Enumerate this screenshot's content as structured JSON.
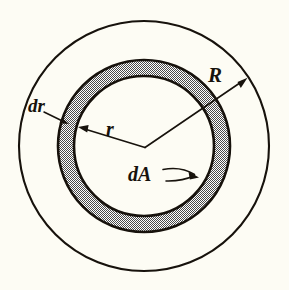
{
  "figure": {
    "background_color": "#fdfcf4",
    "ink_color": "#17120c",
    "shading_color": "#8c8c8c",
    "labels": {
      "dr": "dr",
      "r": "r",
      "R": "R",
      "dA": "dA"
    },
    "geometry": {
      "center_x": 144,
      "center_y": 146,
      "outer_circle_radius": 125,
      "annulus_outer_radius": 86,
      "annulus_inner_radius": 70,
      "ring_thickness": 16
    },
    "annotations": [
      {
        "name": "dr",
        "label": "dr",
        "description": "arrow pointing to ring thickness",
        "label_x": 36,
        "label_y": 112,
        "arrow_from_x": 45,
        "arrow_from_y": 113,
        "arrow_to_x": 68,
        "arrow_to_y": 124
      },
      {
        "name": "r",
        "label": "r",
        "description": "radius line from center to inner circle",
        "label_x": 112,
        "label_y": 134,
        "arrow_from_x": 145,
        "arrow_from_y": 147,
        "arrow_to_x": 79,
        "arrow_to_y": 127
      },
      {
        "name": "R",
        "label": "R",
        "description": "radius line from center to outer circle",
        "label_x": 213,
        "label_y": 78,
        "arrow_from_x": 145,
        "arrow_from_y": 147,
        "arrow_to_x": 247,
        "arrow_to_y": 78
      },
      {
        "name": "dA",
        "label": "dA",
        "description": "curved arrow pointing to shaded annulus area",
        "label_x": 138,
        "label_y": 178,
        "arrow_from_x": 163,
        "arrow_from_y": 172,
        "arrow_to_x": 198,
        "arrow_to_y": 177
      }
    ]
  }
}
